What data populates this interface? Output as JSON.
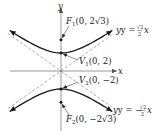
{
  "diagram": {
    "equation": "y^2/4 - x^2/8 = 1",
    "axes": {
      "x_label": "x",
      "y_label": "y"
    },
    "scale": {
      "unit": 1
    },
    "colors": {
      "curve": "#1a1a1a",
      "axis": "#555555",
      "asymptote": "#777777",
      "text": "#222222"
    },
    "points": [
      {
        "name": "F1",
        "label_letter": "F",
        "label_sub": "1",
        "label_rest": "(0, 2√3)",
        "x": 0,
        "y": 3.4641
      },
      {
        "name": "V1",
        "label_letter": "V",
        "label_sub": "1",
        "label_rest": "(0, 2)",
        "x": 0,
        "y": 2
      },
      {
        "name": "V2",
        "label_letter": "V",
        "label_sub": "2",
        "label_rest": "(0, −2)",
        "x": 0,
        "y": -2
      },
      {
        "name": "F2",
        "label_letter": "F",
        "label_sub": "2",
        "label_rest": "(0, −2√3)",
        "x": 0,
        "y": -3.4641
      }
    ],
    "asymptotes": [
      {
        "name": "upper",
        "slope": 0.7071,
        "label_prefix": "y = ",
        "label_num": "√2",
        "label_den": "2",
        "label_var": "x"
      },
      {
        "name": "lower",
        "slope": -0.7071,
        "label_prefix": "y = −",
        "label_num": "√2",
        "label_den": "2",
        "label_var": "x"
      }
    ],
    "x_range": [
      -5.7,
      5.7
    ]
  }
}
